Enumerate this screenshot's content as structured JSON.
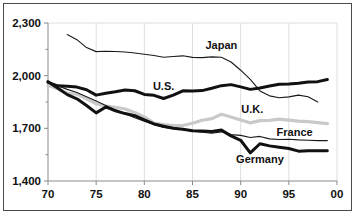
{
  "chart_data": {
    "type": "line",
    "title": "",
    "subtitle": "",
    "xlabel": "",
    "ylabel": "",
    "xlim": [
      70,
      100
    ],
    "ylim": [
      1400,
      2300
    ],
    "yticks": [
      1400,
      1700,
      2000,
      2300
    ],
    "ytick_labels": [
      "1,400",
      "1,700",
      "2,000",
      "2,300"
    ],
    "xticks": [
      70,
      75,
      80,
      85,
      90,
      95,
      100
    ],
    "xtick_labels": [
      "70",
      "75",
      "80",
      "85",
      "90",
      "95",
      "00"
    ],
    "y_minor_ticks": [
      1550,
      1850,
      2150
    ],
    "grid": "vertical-major-only",
    "legend_position": "inline-annotations",
    "series": [
      {
        "name": "Japan",
        "label": "Japan",
        "color": "#1a1a1a",
        "width": 1.1,
        "x": [
          72,
          73,
          74,
          75,
          76,
          77,
          78,
          79,
          80,
          81,
          82,
          83,
          84,
          85,
          86,
          87,
          88,
          89,
          90,
          91,
          92,
          93,
          94,
          95,
          96,
          97,
          98
        ],
        "values": [
          2234,
          2205,
          2160,
          2137,
          2139,
          2138,
          2135,
          2129,
          2122,
          2115,
          2105,
          2109,
          2113,
          2104,
          2103,
          2107,
          2105,
          2078,
          2031,
          1979,
          1913,
          1885,
          1874,
          1879,
          1889,
          1880,
          1850
        ]
      },
      {
        "name": "U.S.",
        "label": "U.S.",
        "color": "#111111",
        "width": 3.0,
        "x": [
          70,
          71,
          72,
          73,
          74,
          75,
          76,
          77,
          78,
          79,
          80,
          81,
          82,
          83,
          84,
          85,
          86,
          87,
          88,
          89,
          90,
          91,
          92,
          93,
          94,
          95,
          96,
          97,
          98,
          99
        ],
        "values": [
          1962,
          1942,
          1940,
          1935,
          1920,
          1889,
          1900,
          1908,
          1918,
          1914,
          1893,
          1888,
          1870,
          1889,
          1914,
          1913,
          1915,
          1928,
          1943,
          1949,
          1936,
          1922,
          1930,
          1941,
          1951,
          1953,
          1957,
          1964,
          1966,
          1978
        ]
      },
      {
        "name": "U.K.",
        "label": "U.K.",
        "color": "#c9c9c9",
        "width": 3.2,
        "x": [
          70,
          71,
          72,
          73,
          74,
          75,
          76,
          77,
          78,
          79,
          80,
          81,
          82,
          83,
          84,
          85,
          86,
          87,
          88,
          89,
          90,
          91,
          92,
          93,
          94,
          95,
          96,
          97,
          98,
          99
        ],
        "values": [
          1945,
          1925,
          1900,
          1895,
          1868,
          1840,
          1826,
          1820,
          1810,
          1790,
          1765,
          1730,
          1722,
          1715,
          1716,
          1729,
          1746,
          1755,
          1780,
          1765,
          1747,
          1731,
          1744,
          1745,
          1752,
          1747,
          1741,
          1738,
          1733,
          1727
        ]
      },
      {
        "name": "France",
        "label": "France",
        "color": "#1a1a1a",
        "width": 1.1,
        "x": [
          70,
          71,
          72,
          73,
          74,
          75,
          76,
          77,
          78,
          79,
          80,
          81,
          82,
          83,
          84,
          85,
          86,
          87,
          88,
          89,
          90,
          91,
          92,
          93,
          94,
          95,
          96,
          97,
          98,
          99
        ],
        "values": [
          1962,
          1942,
          1922,
          1904,
          1880,
          1855,
          1830,
          1806,
          1785,
          1760,
          1740,
          1722,
          1705,
          1700,
          1692,
          1684,
          1678,
          1672,
          1680,
          1664,
          1660,
          1648,
          1654,
          1640,
          1636,
          1638,
          1634,
          1632,
          1630,
          1630
        ]
      },
      {
        "name": "Germany",
        "label": "Germany",
        "color": "#111111",
        "width": 3.0,
        "x": [
          70,
          71,
          72,
          73,
          74,
          75,
          76,
          77,
          78,
          79,
          80,
          81,
          82,
          83,
          84,
          85,
          86,
          87,
          88,
          89,
          90,
          91,
          92,
          93,
          94,
          95,
          96,
          97,
          98,
          99
        ],
        "values": [
          1966,
          1930,
          1892,
          1868,
          1830,
          1788,
          1822,
          1800,
          1784,
          1772,
          1748,
          1725,
          1712,
          1700,
          1695,
          1686,
          1685,
          1682,
          1690,
          1657,
          1632,
          1560,
          1612,
          1600,
          1592,
          1585,
          1570,
          1572,
          1573,
          1572
        ]
      }
    ],
    "annotations": [
      {
        "text": "Japan",
        "x": 88.0,
        "y": 2150
      },
      {
        "text": "U.S.",
        "x": 82.0,
        "y": 1920
      },
      {
        "text": "U.K.",
        "x": 91.2,
        "y": 1790
      },
      {
        "text": "France",
        "x": 95.6,
        "y": 1655
      },
      {
        "text": "Germany",
        "x": 92.0,
        "y": 1500
      }
    ]
  },
  "style": {
    "background": "#ffffff",
    "frame_color": "#4a4a4a",
    "axis_color": "#8a8a8a",
    "grid_color": "#dedede",
    "text_color": "#111111"
  }
}
